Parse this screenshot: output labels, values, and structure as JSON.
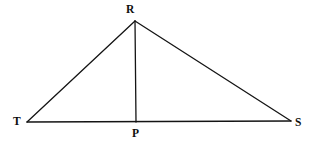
{
  "figure": {
    "kind": "geometry-diagram",
    "background_color": "#ffffff",
    "stroke_color": "#141414",
    "stroke_width": 1.3,
    "canvas": {
      "width": 316,
      "height": 150
    },
    "points": {
      "R": {
        "label": "R",
        "x": 135,
        "y": 21
      },
      "T": {
        "label": "T",
        "x": 27,
        "y": 122
      },
      "S": {
        "label": "S",
        "x": 291,
        "y": 121
      },
      "P": {
        "label": "P",
        "x": 136,
        "y": 122
      }
    },
    "segments": [
      {
        "name": "TR",
        "from": "T",
        "to": "R"
      },
      {
        "name": "RS",
        "from": "R",
        "to": "S"
      },
      {
        "name": "TS",
        "from": "T",
        "to": "S"
      },
      {
        "name": "RP",
        "from": "R",
        "to": "P"
      }
    ],
    "labels": {
      "R": "R",
      "T": "T",
      "S": "S",
      "P": "P"
    }
  }
}
